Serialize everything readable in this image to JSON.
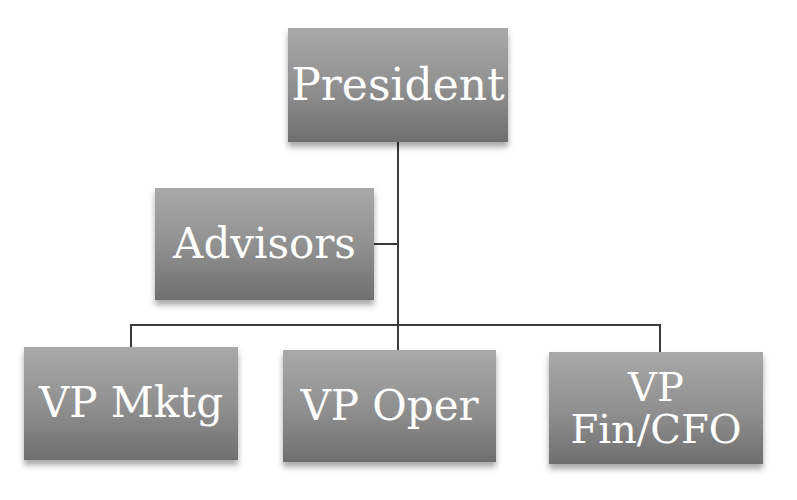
{
  "diagram": {
    "type": "org-chart",
    "colors": {
      "box_top": "#a9a9a9",
      "box_bottom": "#6f6f6f",
      "text": "#ffffff",
      "connector": "#3a3a3a",
      "background": "#ffffff"
    },
    "nodes": {
      "president": {
        "label": "President"
      },
      "advisors": {
        "label": "Advisors"
      },
      "vp_mktg": {
        "label": "VP Mktg"
      },
      "vp_oper": {
        "label": "VP Oper"
      },
      "vp_fin": {
        "label_line1": "VP",
        "label_line2": "Fin/CFO"
      }
    },
    "edges": [
      {
        "from": "President",
        "to": "Advisors",
        "kind": "assistant"
      },
      {
        "from": "President",
        "to": "VP Mktg"
      },
      {
        "from": "President",
        "to": "VP Oper"
      },
      {
        "from": "President",
        "to": "VP Fin/CFO"
      }
    ]
  }
}
